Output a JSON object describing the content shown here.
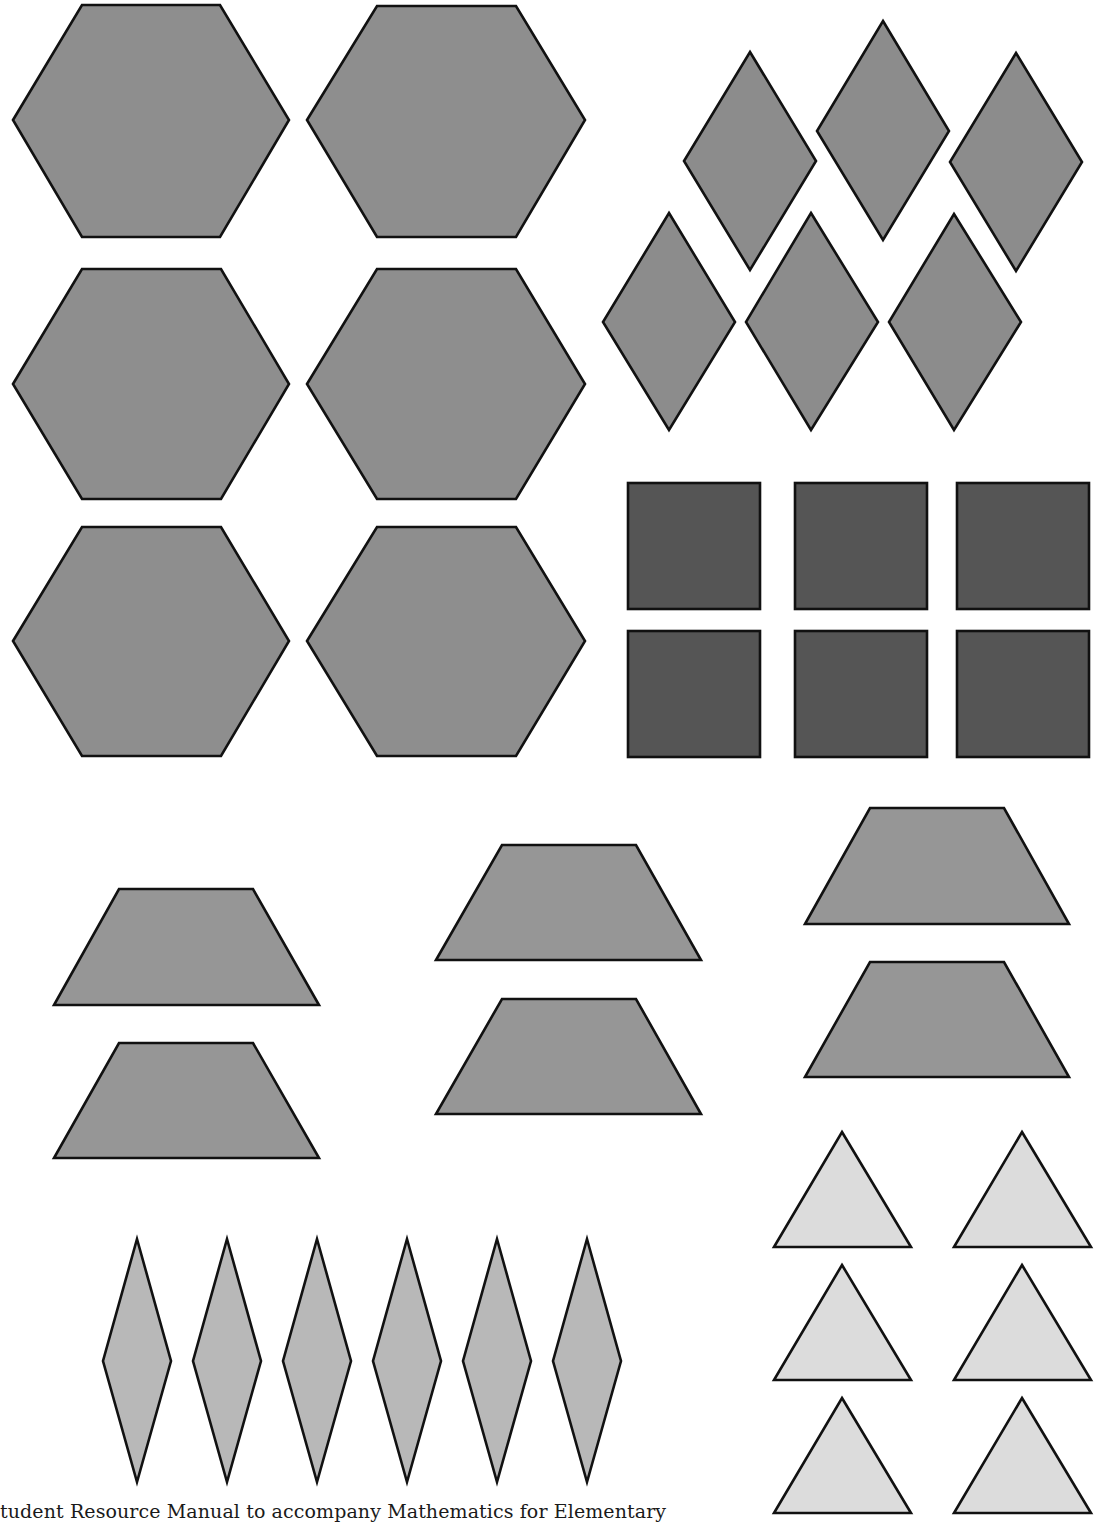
{
  "page": {
    "background": "#ffffff",
    "outline_color": "#111111"
  },
  "footer": {
    "text": "tudent Resource Manual to accompany Mathematics for Elementary"
  },
  "shape_groups": [
    {
      "name": "hexagons",
      "count": 6,
      "fill": "#8e8e8e",
      "shapes": [
        {
          "points": "13,120 82,5 220,5 289,120 220,237 82,237"
        },
        {
          "points": "307,120 377,6 516,6 585,120 516,237 377,237"
        },
        {
          "points": "13,384 82,269 221,269 289,384 221,499 82,499"
        },
        {
          "points": "307,384 377,269 516,269 585,384 516,499 377,499"
        },
        {
          "points": "13,641 82,527 221,527 289,641 221,756 82,756"
        },
        {
          "points": "307,641 377,527 516,527 585,641 516,756 377,756"
        }
      ]
    },
    {
      "name": "rhombi",
      "count": 6,
      "fill": "#8c8c8c",
      "shapes": [
        {
          "points": "750,52 816,161 750,270 684,161"
        },
        {
          "points": "883,21 949,131 883,240 817,131"
        },
        {
          "points": "1016,53 1082,162 1016,271 950,162"
        },
        {
          "points": "669,213 735,322 669,430 603,322"
        },
        {
          "points": "811,213 878,322 811,430 746,322"
        },
        {
          "points": "954,214 1021,322 954,430 889,322"
        }
      ]
    },
    {
      "name": "squares",
      "count": 6,
      "fill": "#555555",
      "shapes": [
        {
          "x": 628,
          "y": 483,
          "w": 132,
          "h": 126
        },
        {
          "x": 795,
          "y": 483,
          "w": 132,
          "h": 126
        },
        {
          "x": 957,
          "y": 483,
          "w": 132,
          "h": 126
        },
        {
          "x": 628,
          "y": 631,
          "w": 132,
          "h": 126
        },
        {
          "x": 795,
          "y": 631,
          "w": 132,
          "h": 126
        },
        {
          "x": 957,
          "y": 631,
          "w": 132,
          "h": 126
        }
      ]
    },
    {
      "name": "trapezoids",
      "count": 6,
      "fill": "#969696",
      "shapes": [
        {
          "points": "119,889 253,889 319,1005 54,1005"
        },
        {
          "points": "119,1043 253,1043 319,1158 54,1158"
        },
        {
          "points": "502,845 636,845 701,960 436,960"
        },
        {
          "points": "502,999 636,999 701,1114 436,1114"
        },
        {
          "points": "870,808 1004,808 1069,924 805,924"
        },
        {
          "points": "870,962 1004,962 1069,1077 805,1077"
        }
      ]
    },
    {
      "name": "thin-rhombi",
      "count": 6,
      "fill": "#b8b8b8",
      "shapes": [
        {
          "points": "137,1239 171,1361 137,1482 103,1361"
        },
        {
          "points": "227,1239 261,1361 227,1482 193,1361"
        },
        {
          "points": "317,1239 351,1361 317,1482 283,1361"
        },
        {
          "points": "407,1239 441,1361 407,1482 373,1361"
        },
        {
          "points": "497,1239 531,1361 497,1482 463,1361"
        },
        {
          "points": "587,1239 621,1361 587,1482 553,1361"
        }
      ]
    },
    {
      "name": "triangles",
      "count": 6,
      "fill": "#dcdcdc",
      "shapes": [
        {
          "points": "842,1132 911,1247 774,1247"
        },
        {
          "points": "1022,1132 1091,1247 954,1247"
        },
        {
          "points": "842,1265 911,1380 774,1380"
        },
        {
          "points": "1022,1265 1091,1380 954,1380"
        },
        {
          "points": "842,1398 911,1513 774,1513"
        },
        {
          "points": "1022,1398 1091,1513 954,1513"
        }
      ]
    }
  ]
}
